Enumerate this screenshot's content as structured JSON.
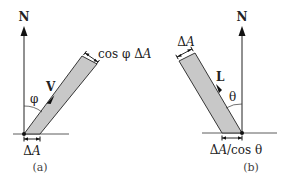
{
  "figure": {
    "panels": [
      {
        "id": "a",
        "caption": "(a)",
        "normal_label": "N",
        "vector_label": "V",
        "angle_label": "φ",
        "base_width_label_delta": "Δ",
        "base_width_label_var": "A",
        "perp_width_label_prefix": "cos φ Δ",
        "perp_width_label_var": "A"
      },
      {
        "id": "b",
        "caption": "(b)",
        "normal_label": "N",
        "vector_label": "L",
        "angle_label": "θ",
        "perp_width_label_delta": "Δ",
        "perp_width_label_var": "A",
        "base_width_label_delta": "Δ",
        "base_width_label_var": "A",
        "base_width_label_suffix": "/cos θ"
      }
    ],
    "colors": {
      "band_fill": "#c8c8c8",
      "line": "#1a1a1a"
    }
  }
}
